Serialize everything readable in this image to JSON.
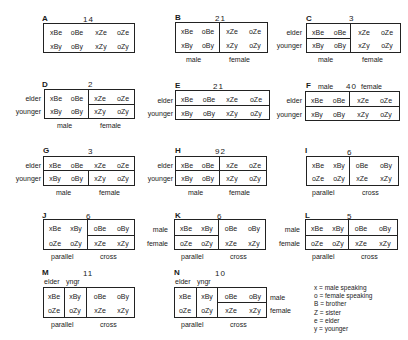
{
  "panels": {
    "A": {
      "letter": "A",
      "count": "14"
    },
    "B": {
      "letter": "B",
      "count": "21",
      "bottom": [
        "male",
        "female"
      ]
    },
    "C": {
      "letter": "C",
      "count": "3",
      "rows": [
        "elder",
        "younger"
      ],
      "bottom": [
        "male",
        "female"
      ]
    },
    "D": {
      "letter": "D",
      "count": "2",
      "rows": [
        "elder",
        "younger"
      ],
      "bottom": [
        "male",
        "female"
      ]
    },
    "E": {
      "letter": "E",
      "count": "21",
      "rows": [
        "elder",
        "younger"
      ]
    },
    "F": {
      "letter": "F",
      "count": "40",
      "top": [
        "male",
        "female"
      ],
      "rows": [
        "elder",
        "younger"
      ]
    },
    "G": {
      "letter": "G",
      "count": "3",
      "rows": [
        "elder",
        "younger"
      ],
      "bottom": [
        "male",
        "female"
      ]
    },
    "H": {
      "letter": "H",
      "count": "92",
      "rows": [
        "elder",
        "younger"
      ],
      "bottom": [
        "male",
        "female"
      ]
    },
    "I": {
      "letter": "I",
      "count": "6",
      "bottom": [
        "parallel",
        "cross"
      ]
    },
    "J": {
      "letter": "J",
      "count": "6",
      "bottom": [
        "parallel",
        "cross"
      ]
    },
    "K": {
      "letter": "K",
      "count": "6",
      "rows": [
        "male",
        "female"
      ],
      "bottom": [
        "parallel",
        "cross"
      ]
    },
    "L": {
      "letter": "L",
      "count": "5",
      "rows": [
        "male",
        "female"
      ],
      "bottom": [
        "parallel",
        "cross"
      ]
    },
    "M": {
      "letter": "M",
      "count": "11",
      "top": [
        "elder",
        "yngr"
      ],
      "bottom": [
        "parallel",
        "cross"
      ]
    },
    "N": {
      "letter": "N",
      "count": "10",
      "top": [
        "elder",
        "yngr"
      ],
      "rows": [
        "male",
        "female"
      ],
      "bottom": [
        "parallel",
        "cross"
      ]
    }
  },
  "cells": {
    "sex_layout": [
      [
        "xBe",
        "oBe",
        "xZe",
        "oZe"
      ],
      [
        "xBy",
        "oBy",
        "xZy",
        "oZy"
      ]
    ],
    "cross_layout": [
      [
        "xBe",
        "xBy",
        "oBe",
        "oBy"
      ],
      [
        "oZe",
        "oZy",
        "xZe",
        "xZy"
      ]
    ]
  },
  "legend": [
    "x = male speaking",
    "o = female speaking",
    "B = brother",
    "Z = sister",
    "e = elder",
    "y = younger"
  ]
}
